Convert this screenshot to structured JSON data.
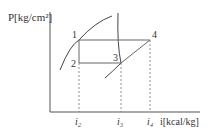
{
  "diagram": {
    "type": "P-i refrigeration cycle diagram",
    "y_axis_label": "P[kg/cm²]",
    "x_axis_label": "i[kcal/kg]",
    "points": [
      {
        "label": "1",
        "x": 79,
        "y": 40
      },
      {
        "label": "2",
        "x": 79,
        "y": 63
      },
      {
        "label": "3",
        "x": 121,
        "y": 63
      },
      {
        "label": "4",
        "x": 150,
        "y": 40
      }
    ],
    "x_ticks": [
      {
        "label": "i₂",
        "x": 79
      },
      {
        "label": "i₃",
        "x": 121
      },
      {
        "label": "i₄",
        "x": 150
      }
    ],
    "colors": {
      "line": "#555555",
      "text": "#333333",
      "curve": "#444444"
    }
  }
}
